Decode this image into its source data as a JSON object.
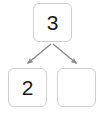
{
  "diagram": {
    "type": "binary-tree",
    "background_color": "#ffffff",
    "node_border_color": "#cfcfcf",
    "node_fill_color": "#ffffff",
    "edge_color": "#8a8a8a",
    "text_color": "#1a1a1a",
    "nodes": [
      {
        "id": "root",
        "label": "3",
        "role": "root-node"
      },
      {
        "id": "left-child",
        "label": "2",
        "role": "left-child-node"
      },
      {
        "id": "right-child",
        "label": "",
        "role": "right-child-node"
      }
    ],
    "edges": [
      {
        "from": "root",
        "to": "left-child",
        "arrow": "arrow-down-left"
      },
      {
        "from": "root",
        "to": "right-child",
        "arrow": "arrow-down-right"
      }
    ]
  }
}
